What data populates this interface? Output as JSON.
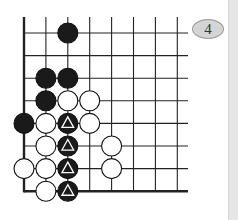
{
  "diagram": {
    "type": "go-board-fragment",
    "label": "4",
    "grid": {
      "cols": 8,
      "rows": 8,
      "origin_x": 24,
      "origin_y": 33,
      "spacing_x": 21.9,
      "spacing_y": 22.6,
      "line_end_x": 188,
      "line_top_y": 17,
      "edges": [
        "left",
        "bottom"
      ]
    },
    "stones": [
      {
        "col": 2,
        "row": 0,
        "color": "black",
        "mark": ""
      },
      {
        "col": 1,
        "row": 2,
        "color": "black",
        "mark": ""
      },
      {
        "col": 2,
        "row": 2,
        "color": "black",
        "mark": ""
      },
      {
        "col": 1,
        "row": 3,
        "color": "black",
        "mark": ""
      },
      {
        "col": 2,
        "row": 3,
        "color": "white",
        "mark": ""
      },
      {
        "col": 3,
        "row": 3,
        "color": "white",
        "mark": ""
      },
      {
        "col": 0,
        "row": 4,
        "color": "black",
        "mark": ""
      },
      {
        "col": 1,
        "row": 4,
        "color": "white",
        "mark": ""
      },
      {
        "col": 2,
        "row": 4,
        "color": "black",
        "mark": "triangle"
      },
      {
        "col": 3,
        "row": 4,
        "color": "white",
        "mark": ""
      },
      {
        "col": 1,
        "row": 5,
        "color": "white",
        "mark": ""
      },
      {
        "col": 2,
        "row": 5,
        "color": "black",
        "mark": "triangle"
      },
      {
        "col": 4,
        "row": 5,
        "color": "white",
        "mark": ""
      },
      {
        "col": 0,
        "row": 6,
        "color": "white",
        "mark": ""
      },
      {
        "col": 1,
        "row": 6,
        "color": "white",
        "mark": ""
      },
      {
        "col": 2,
        "row": 6,
        "color": "black",
        "mark": "triangle"
      },
      {
        "col": 4,
        "row": 6,
        "color": "white",
        "mark": ""
      },
      {
        "col": 1,
        "row": 7,
        "color": "white",
        "mark": ""
      },
      {
        "col": 2,
        "row": 7,
        "color": "black",
        "mark": "triangle"
      }
    ],
    "colors": {
      "line": "#222222",
      "black_stone": "#1a1a1a",
      "white_stone": "#ffffff",
      "label_bg": "#d4d4d4",
      "strip": "#e6e6e6"
    }
  }
}
